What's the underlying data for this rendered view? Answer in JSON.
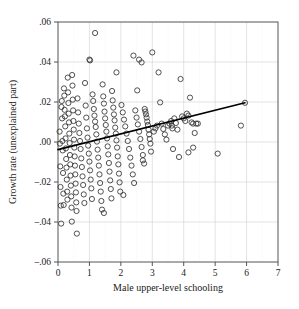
{
  "chart_data": {
    "type": "scatter",
    "title": "",
    "xlabel": "Male upper-level schooling",
    "ylabel": "Growth rate (unexplained part)",
    "xlim": [
      0,
      7
    ],
    "ylim": [
      -0.06,
      0.06
    ],
    "xticks": [
      0,
      1,
      2,
      3,
      4,
      5,
      6,
      7
    ],
    "xticklabels": [
      "0",
      "1",
      "2",
      "3",
      "4",
      "5",
      "6",
      "7"
    ],
    "yticks": [
      -0.06,
      -0.04,
      -0.02,
      0.0,
      0.02,
      0.04,
      0.06
    ],
    "yticklabels": [
      "–.06",
      "–.04",
      "–.02",
      ".00",
      ".02",
      ".04",
      ".06"
    ],
    "grid": true,
    "grid_color": "#d0d0d0",
    "minor_grid": true,
    "minor_grid_color": "#e8e8e8",
    "legend": null,
    "marker": "open-circle",
    "marker_color": "#333333",
    "marker_size": 2.6,
    "fit_line": {
      "name": "regression line",
      "color": "#000000",
      "width": 1.6,
      "x": [
        0.0,
        5.95
      ],
      "y": [
        -0.0038,
        0.0196
      ],
      "slope": 0.00393,
      "intercept": -0.0038,
      "endpoint_marker": true
    },
    "series": [
      {
        "name": "countries",
        "points": [
          [
            0.05,
            0.0052
          ],
          [
            0.06,
            -0.0008
          ],
          [
            0.07,
            -0.0122
          ],
          [
            0.08,
            -0.0225
          ],
          [
            0.09,
            -0.0318
          ],
          [
            0.1,
            -0.0408
          ],
          [
            0.11,
            0.0175
          ],
          [
            0.12,
            0.0205
          ],
          [
            0.13,
            0.0118
          ],
          [
            0.14,
            0.0005
          ],
          [
            0.15,
            -0.0042
          ],
          [
            0.16,
            -0.0155
          ],
          [
            0.17,
            -0.0258
          ],
          [
            0.18,
            -0.0315
          ],
          [
            0.19,
            0.0268
          ],
          [
            0.2,
            0.0232
          ],
          [
            0.21,
            0.0161
          ],
          [
            0.22,
            0.0128
          ],
          [
            0.23,
            0.0078
          ],
          [
            0.24,
            0.0018
          ],
          [
            0.25,
            -0.0032
          ],
          [
            0.26,
            -0.0085
          ],
          [
            0.27,
            -0.0128
          ],
          [
            0.28,
            -0.0188
          ],
          [
            0.29,
            -0.0248
          ],
          [
            0.3,
            -0.0288
          ],
          [
            0.31,
            0.0322
          ],
          [
            0.32,
            0.0248
          ],
          [
            0.33,
            0.0195
          ],
          [
            0.34,
            0.0142
          ],
          [
            0.35,
            0.0098
          ],
          [
            0.36,
            0.0042
          ],
          [
            0.37,
            -0.0005
          ],
          [
            0.38,
            -0.0065
          ],
          [
            0.39,
            -0.0112
          ],
          [
            0.4,
            -0.0168
          ],
          [
            0.41,
            -0.0218
          ],
          [
            0.42,
            -0.0272
          ],
          [
            0.43,
            -0.0328
          ],
          [
            0.44,
            -0.0398
          ],
          [
            0.45,
            0.0335
          ],
          [
            0.46,
            0.0282
          ],
          [
            0.47,
            0.0212
          ],
          [
            0.48,
            0.0158
          ],
          [
            0.49,
            0.0105
          ],
          [
            0.5,
            0.0062
          ],
          [
            0.51,
            0.0012
          ],
          [
            0.52,
            -0.0028
          ],
          [
            0.53,
            -0.0072
          ],
          [
            0.54,
            -0.0118
          ],
          [
            0.55,
            -0.0162
          ],
          [
            0.56,
            -0.0208
          ],
          [
            0.57,
            -0.0252
          ],
          [
            0.58,
            -0.0302
          ],
          [
            0.59,
            -0.0345
          ],
          [
            0.6,
            -0.0458
          ],
          [
            0.62,
            0.0218
          ],
          [
            0.64,
            0.0148
          ],
          [
            0.66,
            0.0092
          ],
          [
            0.68,
            0.0045
          ],
          [
            0.7,
            0.0005
          ],
          [
            0.72,
            -0.0035
          ],
          [
            0.74,
            -0.0082
          ],
          [
            0.76,
            -0.0125
          ],
          [
            0.78,
            -0.0172
          ],
          [
            0.8,
            -0.0215
          ],
          [
            0.82,
            -0.0262
          ],
          [
            0.84,
            -0.0305
          ],
          [
            0.86,
            0.0295
          ],
          [
            0.88,
            0.0182
          ],
          [
            0.9,
            0.0122
          ],
          [
            0.92,
            0.0068
          ],
          [
            0.94,
            0.0022
          ],
          [
            0.96,
            -0.0018
          ],
          [
            0.98,
            -0.0058
          ],
          [
            1.0,
            -0.0098
          ],
          [
            1.02,
            -0.0142
          ],
          [
            1.04,
            -0.0188
          ],
          [
            1.06,
            -0.0232
          ],
          [
            1.08,
            -0.0285
          ],
          [
            1.0,
            0.0412
          ],
          [
            1.02,
            0.0408
          ],
          [
            1.18,
            0.0545
          ],
          [
            1.1,
            0.0238
          ],
          [
            1.12,
            0.0205
          ],
          [
            1.14,
            0.0165
          ],
          [
            1.16,
            0.0132
          ],
          [
            1.18,
            0.0102
          ],
          [
            1.2,
            0.0075
          ],
          [
            1.22,
            0.0038
          ],
          [
            1.24,
            0.0002
          ],
          [
            1.26,
            -0.0038
          ],
          [
            1.28,
            -0.0078
          ],
          [
            1.3,
            -0.0118
          ],
          [
            1.32,
            -0.0162
          ],
          [
            1.34,
            -0.0205
          ],
          [
            1.36,
            -0.0248
          ],
          [
            1.38,
            -0.0295
          ],
          [
            1.4,
            -0.0338
          ],
          [
            1.42,
            0.0288
          ],
          [
            1.44,
            0.0228
          ],
          [
            1.46,
            0.0192
          ],
          [
            1.48,
            0.0152
          ],
          [
            1.5,
            0.0118
          ],
          [
            1.52,
            0.0085
          ],
          [
            1.54,
            0.0052
          ],
          [
            1.56,
            0.0018
          ],
          [
            1.58,
            -0.0022
          ],
          [
            1.6,
            -0.0062
          ],
          [
            1.62,
            -0.0105
          ],
          [
            1.64,
            -0.0148
          ],
          [
            1.66,
            -0.0192
          ],
          [
            1.68,
            -0.0235
          ],
          [
            1.7,
            -0.0282
          ],
          [
            1.46,
            -0.0355
          ],
          [
            1.72,
            0.0255
          ],
          [
            1.74,
            0.0208
          ],
          [
            1.76,
            0.0172
          ],
          [
            1.78,
            0.0138
          ],
          [
            1.8,
            0.0108
          ],
          [
            1.82,
            0.0072
          ],
          [
            1.84,
            0.0042
          ],
          [
            1.86,
            0.0008
          ],
          [
            1.88,
            -0.0028
          ],
          [
            1.9,
            -0.0072
          ],
          [
            1.92,
            -0.0112
          ],
          [
            1.94,
            -0.0158
          ],
          [
            1.96,
            -0.0202
          ],
          [
            1.98,
            -0.0248
          ],
          [
            1.86,
            0.0348
          ],
          [
            2.02,
            0.0185
          ],
          [
            2.06,
            0.0148
          ],
          [
            2.1,
            0.0112
          ],
          [
            2.14,
            0.0078
          ],
          [
            2.18,
            0.0042
          ],
          [
            2.22,
            0.0005
          ],
          [
            2.26,
            -0.0035
          ],
          [
            2.3,
            -0.0078
          ],
          [
            2.34,
            -0.0118
          ],
          [
            2.38,
            -0.0162
          ],
          [
            2.42,
            -0.0205
          ],
          [
            2.08,
            -0.0265
          ],
          [
            2.46,
            0.0158
          ],
          [
            2.5,
            0.0122
          ],
          [
            2.54,
            0.0088
          ],
          [
            2.58,
            0.0052
          ],
          [
            2.62,
            0.0015
          ],
          [
            2.66,
            -0.0025
          ],
          [
            2.7,
            -0.0065
          ],
          [
            2.74,
            -0.0108
          ],
          [
            2.4,
            0.0432
          ],
          [
            2.58,
            0.0412
          ],
          [
            2.66,
            0.0398
          ],
          [
            2.52,
            0.0258
          ],
          [
            2.76,
            0.0165
          ],
          [
            2.78,
            0.0152
          ],
          [
            2.8,
            0.0138
          ],
          [
            2.82,
            0.0122
          ],
          [
            2.84,
            0.0102
          ],
          [
            2.86,
            0.0085
          ],
          [
            2.88,
            0.0062
          ],
          [
            2.9,
            0.0038
          ],
          [
            2.92,
            0.0015
          ],
          [
            2.94,
            -0.0008
          ],
          [
            2.96,
            -0.0048
          ],
          [
            2.7,
            -0.0092
          ],
          [
            3.0,
            0.0448
          ],
          [
            3.05,
            0.0052
          ],
          [
            3.1,
            0.0068
          ],
          [
            3.15,
            0.0082
          ],
          [
            3.2,
            0.0348
          ],
          [
            3.25,
            0.0198
          ],
          [
            3.3,
            0.0092
          ],
          [
            3.35,
            0.0065
          ],
          [
            3.4,
            0.0038
          ],
          [
            3.45,
            0.0012
          ],
          [
            3.5,
            0.0082
          ],
          [
            3.55,
            0.0092
          ],
          [
            3.6,
            0.0105
          ],
          [
            3.62,
            0.0082
          ],
          [
            3.64,
            0.0068
          ],
          [
            3.66,
            -0.0035
          ],
          [
            3.7,
            0.0118
          ],
          [
            3.75,
            0.0095
          ],
          [
            3.8,
            0.0062
          ],
          [
            3.85,
            -0.0075
          ],
          [
            3.9,
            0.0315
          ],
          [
            3.95,
            0.0128
          ],
          [
            4.0,
            0.0118
          ],
          [
            4.05,
            0.0105
          ],
          [
            4.1,
            0.0142
          ],
          [
            4.15,
            0.0132
          ],
          [
            4.2,
            0.0222
          ],
          [
            4.25,
            0.0098
          ],
          [
            4.3,
            0.0092
          ],
          [
            4.35,
            0.0045
          ],
          [
            4.4,
            0.0092
          ],
          [
            4.45,
            0.0092
          ],
          [
            4.3,
            -0.0028
          ],
          [
            4.15,
            -0.0052
          ],
          [
            5.08,
            -0.0058
          ],
          [
            5.82,
            0.0082
          ],
          [
            5.95,
            0.0196
          ]
        ]
      }
    ]
  },
  "axes": {
    "x_axis_name": "Male upper-level schooling",
    "y_axis_name": "Growth rate (unexplained part)"
  }
}
